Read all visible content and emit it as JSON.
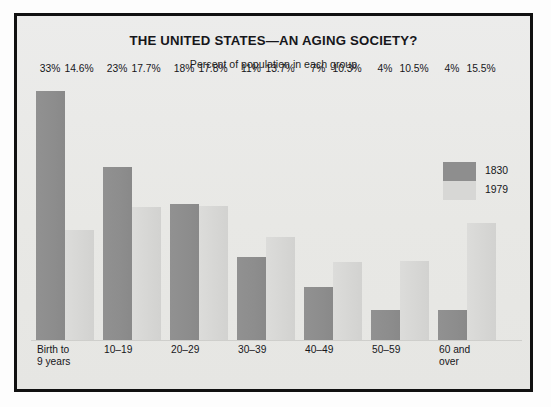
{
  "chart_data": {
    "type": "bar",
    "title": "THE UNITED STATES—AN AGING SOCIETY?",
    "subtitle": "Percent of population in each group",
    "xlabel": "",
    "ylabel": "",
    "ylim": [
      0,
      35
    ],
    "grid": false,
    "legend_position": "right",
    "categories": [
      "Birth to\n9 years",
      "10–19",
      "20–29",
      "30–39",
      "40–49",
      "50–59",
      "60 and\nover"
    ],
    "series": [
      {
        "name": "1830",
        "color": "#8e8e8e",
        "values": [
          33,
          23,
          18,
          11,
          7,
          4,
          4
        ],
        "labels": [
          "33%",
          "23%",
          "18%",
          "11%",
          "7%",
          "4%",
          "4%"
        ]
      },
      {
        "name": "1979",
        "color": "#d7d7d5",
        "values": [
          14.6,
          17.7,
          17.8,
          13.7,
          10.3,
          10.5,
          15.5
        ],
        "labels": [
          "14.6%",
          "17.7%",
          "17.8%",
          "13.7%",
          "10.3%",
          "10.5%",
          "15.5%"
        ]
      }
    ]
  },
  "categories_display": [
    {
      "line1": "Birth to",
      "line2": "9 years"
    },
    {
      "line1": "10–19",
      "line2": ""
    },
    {
      "line1": "20–29",
      "line2": ""
    },
    {
      "line1": "30–39",
      "line2": ""
    },
    {
      "line1": "40–49",
      "line2": ""
    },
    {
      "line1": "50–59",
      "line2": ""
    },
    {
      "line1": "60 and",
      "line2": "over"
    }
  ],
  "legend": {
    "items": [
      {
        "label": "1830",
        "color": "#8e8e8e"
      },
      {
        "label": "1979",
        "color": "#d7d7d5"
      }
    ]
  },
  "colors": {
    "series_1830": "#8e8e8e",
    "series_1979": "#d7d7d5",
    "background": "#e8e8e5",
    "frame": "#111111",
    "text": "#16161a"
  }
}
